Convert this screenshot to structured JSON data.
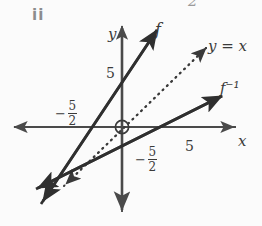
{
  "figure": {
    "part_label": "ii",
    "corner_artifact": "2",
    "background_color": "#fbfbfb",
    "stroke_color": "#2f2f2f",
    "axis_color": "#4a4a4a",
    "text_color": "#3a3a3a"
  },
  "axes": {
    "x_axis_label": "x",
    "y_axis_label": "y",
    "x_tick_positive": "5",
    "y_tick_positive": "5",
    "x_intercept_negative": {
      "sign": "−",
      "numerator": "5",
      "denominator": "2"
    },
    "y_intercept_negative": {
      "sign": "−",
      "numerator": "5",
      "denominator": "2"
    },
    "origin_marker": "circled-origin"
  },
  "curves": [
    {
      "name": "f",
      "label": "f",
      "style": "solid",
      "description": "steep increasing line through (-5/2, 0) and (0, 5)",
      "slope": 2,
      "y_intercept": 5,
      "x_intercept": -2.5
    },
    {
      "name": "f-inverse",
      "label": "f⁻¹",
      "style": "solid",
      "description": "shallow increasing line through (0, -5/2) and (5/2, 0)",
      "slope": 0.5,
      "y_intercept": -2.5,
      "x_intercept": 2.5
    },
    {
      "name": "y-equals-x",
      "label": "y = x",
      "style": "dotted",
      "description": "line of reflection",
      "slope": 1,
      "y_intercept": 0
    }
  ]
}
